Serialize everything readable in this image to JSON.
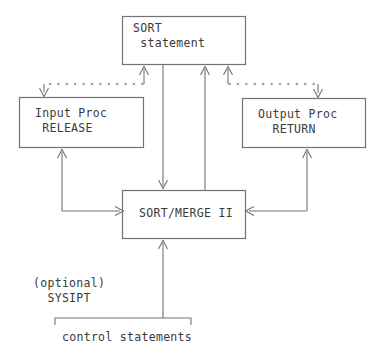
{
  "diagram": {
    "colors": {
      "line": "#737373",
      "text": "#3a3a3a",
      "background": "#ffffff"
    },
    "boxes": [
      {
        "id": "sort-statement",
        "name": "sort-statement-box",
        "line1": "SORT",
        "line2": " statement",
        "text": "SORT\n statement"
      },
      {
        "id": "input-proc",
        "name": "input-proc-box",
        "line1": "Input Proc",
        "line2": " RELEASE",
        "text": "Input Proc\n RELEASE"
      },
      {
        "id": "output-proc",
        "name": "output-proc-box",
        "line1": "Output Proc",
        "line2": "  RETURN",
        "text": "Output Proc\n  RETURN"
      },
      {
        "id": "sort-merge",
        "name": "sort-merge-box",
        "line1": "SORT/MERGE II",
        "text": "SORT/MERGE II"
      }
    ],
    "labels": [
      {
        "id": "optional-sysipt",
        "name": "optional-sysipt-label",
        "line1": "(optional)",
        "line2": "  SYSIPT",
        "text": "(optional)\n  SYSIPT"
      },
      {
        "id": "control-statements",
        "name": "control-statements-label",
        "text": "control statements"
      }
    ],
    "connectors": [
      {
        "id": "sort-to-sortmerge",
        "style": "solid",
        "direction": "down",
        "from": "sort-statement",
        "to": "sort-merge"
      },
      {
        "id": "sortmerge-to-sort",
        "style": "solid",
        "direction": "up",
        "from": "sort-merge",
        "to": "sort-statement"
      },
      {
        "id": "sort-to-input-proc",
        "style": "dotted",
        "direction": "down",
        "from": "sort-statement",
        "to": "input-proc"
      },
      {
        "id": "sort-to-output-proc",
        "style": "dotted",
        "direction": "down",
        "from": "sort-statement",
        "to": "output-proc"
      },
      {
        "id": "input-proc-to-sortmerge",
        "style": "solid",
        "direction": "right",
        "from": "input-proc",
        "to": "sort-merge"
      },
      {
        "id": "output-proc-to-sortmerge",
        "style": "solid",
        "direction": "left",
        "from": "output-proc",
        "to": "sort-merge"
      },
      {
        "id": "control-to-sortmerge",
        "style": "solid",
        "direction": "up",
        "from": "control-statements",
        "to": "sort-merge"
      }
    ]
  }
}
